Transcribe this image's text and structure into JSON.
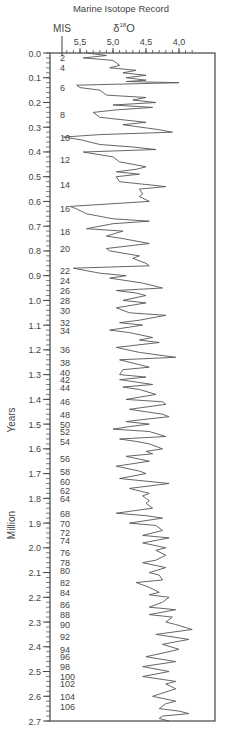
{
  "chart_data": {
    "type": "line",
    "title": "Marine Isotope Record",
    "xlabel": "δ18O",
    "ylabel": "Million Years",
    "mis_label": "MIS",
    "x_axis": {
      "reversed": true,
      "range": [
        5.8,
        3.7
      ],
      "ticks": [
        5.5,
        5.0,
        4.5,
        4.0
      ],
      "tick_labels": [
        "5,5",
        "5,0",
        "4,5",
        "4,0"
      ]
    },
    "y_axis": {
      "reversed": true,
      "range": [
        0.0,
        2.7
      ],
      "ticks": [
        0.0,
        0.1,
        0.2,
        0.3,
        0.4,
        0.5,
        0.6,
        0.7,
        0.8,
        0.9,
        1.0,
        1.1,
        1.2,
        1.3,
        1.4,
        1.5,
        1.6,
        1.7,
        1.8,
        1.9,
        2.0,
        2.1,
        2.2,
        2.3,
        2.4,
        2.5,
        2.6,
        2.7
      ]
    },
    "mis_stages": [
      {
        "label": "2",
        "age": 0.02
      },
      {
        "label": "4",
        "age": 0.06
      },
      {
        "label": "6",
        "age": 0.14
      },
      {
        "label": "8",
        "age": 0.25
      },
      {
        "label": "10",
        "age": 0.34
      },
      {
        "label": "12",
        "age": 0.43
      },
      {
        "label": "14",
        "age": 0.53
      },
      {
        "label": "16",
        "age": 0.63
      },
      {
        "label": "18",
        "age": 0.72
      },
      {
        "label": "20",
        "age": 0.79
      },
      {
        "label": "22",
        "age": 0.88
      },
      {
        "label": "24",
        "age": 0.92
      },
      {
        "label": "26",
        "age": 0.96
      },
      {
        "label": "28",
        "age": 1.0
      },
      {
        "label": "30",
        "age": 1.04
      },
      {
        "label": "32",
        "age": 1.09
      },
      {
        "label": "34",
        "age": 1.12
      },
      {
        "label": "36",
        "age": 1.2
      },
      {
        "label": "38",
        "age": 1.25
      },
      {
        "label": "40",
        "age": 1.29
      },
      {
        "label": "42",
        "age": 1.32
      },
      {
        "label": "44",
        "age": 1.35
      },
      {
        "label": "46",
        "age": 1.41
      },
      {
        "label": "48",
        "age": 1.46
      },
      {
        "label": "50",
        "age": 1.5
      },
      {
        "label": "52",
        "age": 1.53
      },
      {
        "label": "54",
        "age": 1.57
      },
      {
        "label": "56",
        "age": 1.64
      },
      {
        "label": "58",
        "age": 1.69
      },
      {
        "label": "60",
        "age": 1.73
      },
      {
        "label": "62",
        "age": 1.77
      },
      {
        "label": "64",
        "age": 1.8
      },
      {
        "label": "68",
        "age": 1.86
      },
      {
        "label": "70",
        "age": 1.9
      },
      {
        "label": "72",
        "age": 1.94
      },
      {
        "label": "74",
        "age": 1.97
      },
      {
        "label": "76",
        "age": 2.02
      },
      {
        "label": "78",
        "age": 2.06
      },
      {
        "label": "80",
        "age": 2.09
      },
      {
        "label": "82",
        "age": 2.14
      },
      {
        "label": "84",
        "age": 2.18
      },
      {
        "label": "86",
        "age": 2.23
      },
      {
        "label": "88",
        "age": 2.27
      },
      {
        "label": "90",
        "age": 2.31
      },
      {
        "label": "92",
        "age": 2.36
      },
      {
        "label": "94",
        "age": 2.41
      },
      {
        "label": "96",
        "age": 2.44
      },
      {
        "label": "98",
        "age": 2.48
      },
      {
        "label": "100",
        "age": 2.52
      },
      {
        "label": "102",
        "age": 2.55
      },
      {
        "label": "104",
        "age": 2.6
      },
      {
        "label": "106",
        "age": 2.64
      }
    ],
    "series": [
      {
        "name": "δ18O",
        "points": [
          [
            0.0,
            5.4
          ],
          [
            0.01,
            5.1
          ],
          [
            0.02,
            5.45
          ],
          [
            0.03,
            5.0
          ],
          [
            0.05,
            4.9
          ],
          [
            0.06,
            5.05
          ],
          [
            0.07,
            4.65
          ],
          [
            0.08,
            4.85
          ],
          [
            0.09,
            4.5
          ],
          [
            0.1,
            4.8
          ],
          [
            0.11,
            4.5
          ],
          [
            0.115,
            4.8
          ],
          [
            0.12,
            4.0
          ],
          [
            0.13,
            5.55
          ],
          [
            0.14,
            5.5
          ],
          [
            0.15,
            5.2
          ],
          [
            0.17,
            5.1
          ],
          [
            0.18,
            4.5
          ],
          [
            0.19,
            4.7
          ],
          [
            0.2,
            4.35
          ],
          [
            0.21,
            5.0
          ],
          [
            0.22,
            4.4
          ],
          [
            0.23,
            4.95
          ],
          [
            0.24,
            5.3
          ],
          [
            0.26,
            5.2
          ],
          [
            0.28,
            4.5
          ],
          [
            0.29,
            4.85
          ],
          [
            0.31,
            4.3
          ],
          [
            0.32,
            4.1
          ],
          [
            0.33,
            5.2
          ],
          [
            0.34,
            5.75
          ],
          [
            0.35,
            5.5
          ],
          [
            0.37,
            5.2
          ],
          [
            0.38,
            4.7
          ],
          [
            0.39,
            4.35
          ],
          [
            0.4,
            5.45
          ],
          [
            0.42,
            5.0
          ],
          [
            0.44,
            4.9
          ],
          [
            0.45,
            4.7
          ],
          [
            0.46,
            4.5
          ],
          [
            0.47,
            4.65
          ],
          [
            0.48,
            4.95
          ],
          [
            0.49,
            4.6
          ],
          [
            0.5,
            4.95
          ],
          [
            0.52,
            4.9
          ],
          [
            0.54,
            4.2
          ],
          [
            0.55,
            4.6
          ],
          [
            0.57,
            4.55
          ],
          [
            0.58,
            4.6
          ],
          [
            0.6,
            4.45
          ],
          [
            0.62,
            5.65
          ],
          [
            0.63,
            5.55
          ],
          [
            0.65,
            5.4
          ],
          [
            0.67,
            5.0
          ],
          [
            0.68,
            4.45
          ],
          [
            0.69,
            5.0
          ],
          [
            0.71,
            5.4
          ],
          [
            0.72,
            4.85
          ],
          [
            0.74,
            5.1
          ],
          [
            0.75,
            4.85
          ],
          [
            0.77,
            4.45
          ],
          [
            0.79,
            5.1
          ],
          [
            0.8,
            5.05
          ],
          [
            0.82,
            4.6
          ],
          [
            0.83,
            4.7
          ],
          [
            0.85,
            4.5
          ],
          [
            0.86,
            4.45
          ],
          [
            0.87,
            5.6
          ],
          [
            0.89,
            5.2
          ],
          [
            0.9,
            4.8
          ],
          [
            0.91,
            5.05
          ],
          [
            0.93,
            4.55
          ],
          [
            0.95,
            4.25
          ],
          [
            0.96,
            4.95
          ],
          [
            0.97,
            4.65
          ],
          [
            0.98,
            4.5
          ],
          [
            1.0,
            4.85
          ],
          [
            1.01,
            4.5
          ],
          [
            1.03,
            4.95
          ],
          [
            1.05,
            4.75
          ],
          [
            1.06,
            4.2
          ],
          [
            1.08,
            4.6
          ],
          [
            1.09,
            4.9
          ],
          [
            1.1,
            4.55
          ],
          [
            1.12,
            5.05
          ],
          [
            1.13,
            4.75
          ],
          [
            1.15,
            4.4
          ],
          [
            1.16,
            4.6
          ],
          [
            1.17,
            4.3
          ],
          [
            1.19,
            4.95
          ],
          [
            1.21,
            4.6
          ],
          [
            1.23,
            4.05
          ],
          [
            1.24,
            4.9
          ],
          [
            1.26,
            4.6
          ],
          [
            1.27,
            4.45
          ],
          [
            1.28,
            4.85
          ],
          [
            1.3,
            4.9
          ],
          [
            1.31,
            4.5
          ],
          [
            1.32,
            4.9
          ],
          [
            1.34,
            4.4
          ],
          [
            1.35,
            4.85
          ],
          [
            1.36,
            4.6
          ],
          [
            1.38,
            4.35
          ],
          [
            1.4,
            4.8
          ],
          [
            1.41,
            4.25
          ],
          [
            1.42,
            4.2
          ],
          [
            1.44,
            4.75
          ],
          [
            1.46,
            4.25
          ],
          [
            1.47,
            4.15
          ],
          [
            1.48,
            4.5
          ],
          [
            1.49,
            4.8
          ],
          [
            1.5,
            4.45
          ],
          [
            1.51,
            4.75
          ],
          [
            1.52,
            5.0
          ],
          [
            1.53,
            4.45
          ],
          [
            1.55,
            4.2
          ],
          [
            1.56,
            4.9
          ],
          [
            1.57,
            4.65
          ],
          [
            1.58,
            4.45
          ],
          [
            1.6,
            4.25
          ],
          [
            1.61,
            4.5
          ],
          [
            1.62,
            4.4
          ],
          [
            1.63,
            4.8
          ],
          [
            1.65,
            4.45
          ],
          [
            1.67,
            4.95
          ],
          [
            1.69,
            4.6
          ],
          [
            1.7,
            4.5
          ],
          [
            1.72,
            4.9
          ],
          [
            1.74,
            4.15
          ],
          [
            1.76,
            4.75
          ],
          [
            1.78,
            4.45
          ],
          [
            1.79,
            4.55
          ],
          [
            1.81,
            4.45
          ],
          [
            1.82,
            4.5
          ],
          [
            1.84,
            4.4
          ],
          [
            1.86,
            4.95
          ],
          [
            1.87,
            4.5
          ],
          [
            1.88,
            4.25
          ],
          [
            1.9,
            4.75
          ],
          [
            1.91,
            4.35
          ],
          [
            1.93,
            4.25
          ],
          [
            1.95,
            4.55
          ],
          [
            1.96,
            4.15
          ],
          [
            1.98,
            4.55
          ],
          [
            2.0,
            4.2
          ],
          [
            2.01,
            4.35
          ],
          [
            2.03,
            4.2
          ],
          [
            2.05,
            4.35
          ],
          [
            2.06,
            4.55
          ],
          [
            2.08,
            4.2
          ],
          [
            2.1,
            4.45
          ],
          [
            2.11,
            4.3
          ],
          [
            2.13,
            4.25
          ],
          [
            2.14,
            4.65
          ],
          [
            2.16,
            4.45
          ],
          [
            2.18,
            4.3
          ],
          [
            2.19,
            4.45
          ],
          [
            2.2,
            4.15
          ],
          [
            2.22,
            4.25
          ],
          [
            2.24,
            4.45
          ],
          [
            2.25,
            4.05
          ],
          [
            2.27,
            4.45
          ],
          [
            2.28,
            4.1
          ],
          [
            2.3,
            4.2
          ],
          [
            2.31,
            4.05
          ],
          [
            2.33,
            3.8
          ],
          [
            2.35,
            4.35
          ],
          [
            2.37,
            3.85
          ],
          [
            2.39,
            4.25
          ],
          [
            2.41,
            4.0
          ],
          [
            2.42,
            4.15
          ],
          [
            2.44,
            4.5
          ],
          [
            2.46,
            4.05
          ],
          [
            2.48,
            4.55
          ],
          [
            2.49,
            4.35
          ],
          [
            2.5,
            4.15
          ],
          [
            2.52,
            4.55
          ],
          [
            2.54,
            4.05
          ],
          [
            2.55,
            4.2
          ],
          [
            2.57,
            4.05
          ],
          [
            2.6,
            4.4
          ],
          [
            2.62,
            4.05
          ],
          [
            2.63,
            4.2
          ],
          [
            2.65,
            4.3
          ],
          [
            2.66,
            4.0
          ],
          [
            2.67,
            3.85
          ],
          [
            2.68,
            4.25
          ],
          [
            2.69,
            4.3
          ],
          [
            2.7,
            4.15
          ]
        ]
      }
    ]
  },
  "labels": {
    "title": "Marine Isotope Record",
    "mis": "MIS",
    "delta": "δ",
    "superscript": "18",
    "element": "O",
    "ylabel_years": "Years",
    "ylabel_million": "Million"
  },
  "colors": {
    "line": "#555555",
    "axis": "#444444",
    "text": "#444444"
  }
}
